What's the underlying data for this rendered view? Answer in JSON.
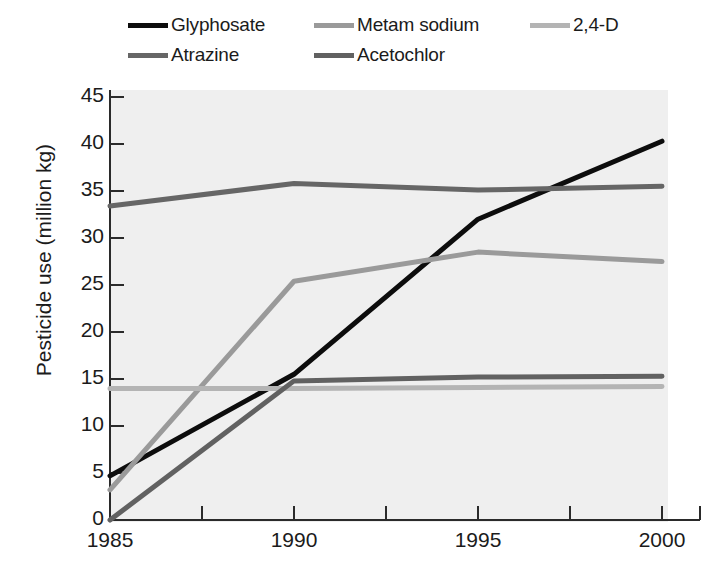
{
  "chart_data": {
    "type": "line",
    "title": "",
    "xlabel": "",
    "ylabel": "Pesticide use (million kg)",
    "x": [
      1985,
      1990,
      1995,
      2000
    ],
    "xtick_labels": [
      "1985",
      "1990",
      "1995",
      "2000"
    ],
    "ytick_labels": [
      "0",
      "5",
      "10",
      "15",
      "20",
      "25",
      "30",
      "35",
      "40",
      "45"
    ],
    "yticks": [
      0,
      5,
      10,
      15,
      20,
      25,
      30,
      35,
      40,
      45
    ],
    "xlim": [
      1985,
      2000
    ],
    "ylim": [
      0,
      45
    ],
    "grid": false,
    "legend_position": "above-plot",
    "plot_background": "#efefef",
    "series": [
      {
        "name": "Glyphosate",
        "color": "#0d0d0d",
        "values": [
          4.7,
          15.5,
          32.0,
          40.3
        ]
      },
      {
        "name": "Metam sodium",
        "color": "#9a9a9a",
        "values": [
          3.2,
          25.4,
          28.5,
          27.5
        ]
      },
      {
        "name": "2,4-D",
        "color": "#b4b4b4",
        "values": [
          14.0,
          14.0,
          14.1,
          14.2
        ]
      },
      {
        "name": "Atrazine",
        "color": "#666666",
        "values": [
          33.4,
          35.8,
          35.1,
          35.5
        ]
      },
      {
        "name": "Acetochlor",
        "color": "#616161",
        "values": [
          0.0,
          14.8,
          15.2,
          15.3
        ]
      }
    ]
  },
  "legend": {
    "rows": [
      [
        {
          "label": "Glyphosate",
          "color": "#0d0d0d",
          "name": "glyphosate"
        },
        {
          "label": "Metam sodium",
          "color": "#9a9a9a",
          "name": "metam-sodium"
        },
        {
          "label": "2,4-D",
          "color": "#b4b4b4",
          "name": "2-4-d"
        }
      ],
      [
        {
          "label": "Atrazine",
          "color": "#666666",
          "name": "atrazine"
        },
        {
          "label": "Acetochlor",
          "color": "#616161",
          "name": "acetochlor"
        }
      ]
    ]
  },
  "axes": {
    "y_axis_title": "Pesticide use (million kg)"
  }
}
